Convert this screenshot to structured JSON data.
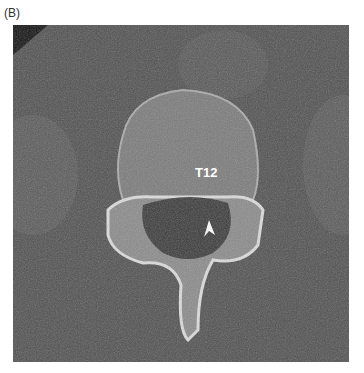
{
  "figure": {
    "panel_label": "(B)",
    "vertebra_label": "T12",
    "annotation": "arrowhead"
  }
}
